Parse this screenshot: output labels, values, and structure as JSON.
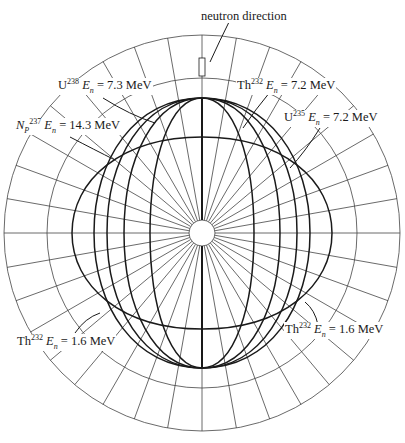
{
  "diagram": {
    "type": "polar angular distribution diagram",
    "title": "neutron direction",
    "center": [
      202,
      233
    ],
    "outer_radius": 198,
    "inner_ring_radius": 155,
    "hub_radius": 13,
    "radial_line_step_deg": 10,
    "colors": {
      "ink": "#1a1a1a",
      "grid": "#444444",
      "background": "#ffffff"
    }
  },
  "labels": [
    {
      "id": "neutron-direction",
      "text": "neutron direction",
      "x": 200,
      "y": 10
    },
    {
      "id": "u238",
      "element": "U",
      "mass": "238",
      "energy": "= 7.3 MeV",
      "x": 57,
      "y": 82
    },
    {
      "id": "np237",
      "element": "N",
      "element_sub": "P",
      "mass": "237",
      "energy": "= 14.3 MeV",
      "x": 15,
      "y": 122
    },
    {
      "id": "th232-top",
      "element": "Th",
      "mass": "232",
      "energy": "= 7.2 MeV",
      "x": 236,
      "y": 80
    },
    {
      "id": "u235",
      "element": "U",
      "mass": "235",
      "energy": "= 7.2 MeV",
      "x": 283,
      "y": 112
    },
    {
      "id": "th232-bl",
      "element": "Th",
      "mass": "232",
      "energy": "= 1.6 MeV",
      "x": 16,
      "y": 336
    },
    {
      "id": "th232-br",
      "element": "Th",
      "mass": "232",
      "energy": "= 1.6 MeV",
      "x": 284,
      "y": 324
    }
  ],
  "energy_symbol": "E",
  "energy_symbol_sub": "n",
  "lobes": [
    {
      "name": "tall-lobe-1",
      "half_width": 52,
      "top": 135,
      "bottom": 135
    },
    {
      "name": "tall-lobe-2",
      "half_width": 78,
      "top": 135,
      "bottom": 135
    },
    {
      "name": "tall-lobe-3",
      "half_width": 95,
      "top": 135,
      "bottom": 135
    },
    {
      "name": "tall-lobe-4",
      "half_width": 108,
      "top": 135,
      "bottom": 135
    },
    {
      "name": "np237-14.3MeV-lobe",
      "half_width": 130,
      "top": 96,
      "bottom": 96
    }
  ]
}
